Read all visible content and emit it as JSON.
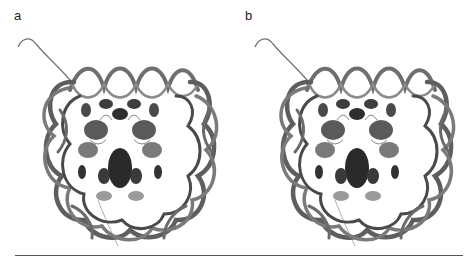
{
  "figure": {
    "panels": [
      {
        "label": "a",
        "description": "nucleosome core particle ribbon model, left stereo view"
      },
      {
        "label": "b",
        "description": "nucleosome core particle ribbon model, right stereo view"
      }
    ],
    "colors": {
      "dna_ribbon": "#6e6e6e",
      "dna_ribbon_dark": "#4a4a4a",
      "histone_dark": "#2e2e2e",
      "histone_mid": "#5a5a5a",
      "histone_light": "#9a9a9a",
      "tail": "#707070",
      "rule": "#555555"
    }
  }
}
